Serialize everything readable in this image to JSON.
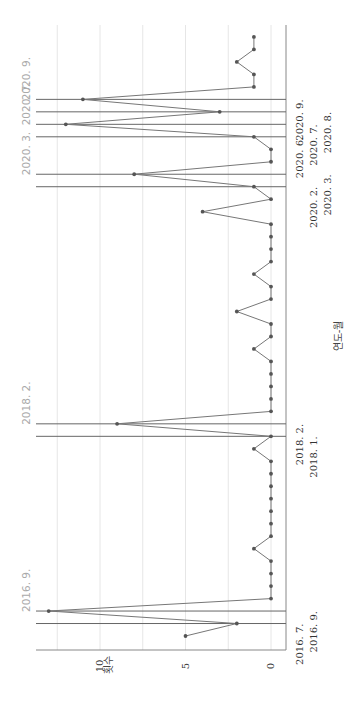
{
  "chart_data": {
    "type": "line",
    "orientation": "rotated-90-ccw",
    "title": "",
    "xlabel": "연도-월",
    "ylabel": "횟수",
    "ylim": [
      0,
      13.5
    ],
    "yticks": [
      0,
      5,
      10
    ],
    "grid": true,
    "gridlines": [
      0,
      2.5,
      5,
      7.5,
      10,
      12.5
    ],
    "values": [
      5,
      2,
      13,
      0,
      0,
      0,
      0,
      1,
      0,
      0,
      0,
      0,
      0,
      0,
      0,
      1,
      0,
      9,
      0,
      0,
      0,
      0,
      0,
      1,
      0,
      0,
      2,
      0,
      0,
      1,
      0,
      0,
      0,
      0,
      4,
      0,
      1,
      8,
      0,
      0,
      1,
      12,
      3,
      11,
      1,
      1,
      2,
      1,
      1
    ],
    "highlight_indices": [
      1,
      2,
      16,
      17,
      36,
      37,
      40,
      41,
      42,
      43
    ],
    "x_tick_labels": [
      {
        "index": 1,
        "label": "2016. 7.",
        "row": 0
      },
      {
        "index": 2,
        "label": "2016. 9.",
        "row": 1
      },
      {
        "index": 16,
        "label": "2018. 1.",
        "row": 1
      },
      {
        "index": 17,
        "label": "2018. 2.",
        "row": 0
      },
      {
        "index": 36,
        "label": "2020. 2.",
        "row": 1
      },
      {
        "index": 37,
        "label": "2020. 3.",
        "row": 2
      },
      {
        "index": 40,
        "label": "2020. 6.",
        "row": 0
      },
      {
        "index": 41,
        "label": "2020. 7.",
        "row": 1
      },
      {
        "index": 42,
        "label": "2020. 8.",
        "row": 2
      },
      {
        "index": 43,
        "label": "2020. 9.",
        "row": 0
      }
    ],
    "annotations": [
      {
        "index": 2,
        "label": "2016. 9."
      },
      {
        "index": 17,
        "label": "2018. 2."
      },
      {
        "index": 37,
        "label": "2020. 3."
      },
      {
        "index": 41,
        "label": "2020. 7."
      },
      {
        "index": 43,
        "label": "2020. 9."
      }
    ]
  },
  "colors": {
    "line": "#777777",
    "point": "#555555",
    "highlight_line": "#666666",
    "grid": "#e6e6e6",
    "axis": "#888888",
    "annotation": "#aaaaaa"
  }
}
